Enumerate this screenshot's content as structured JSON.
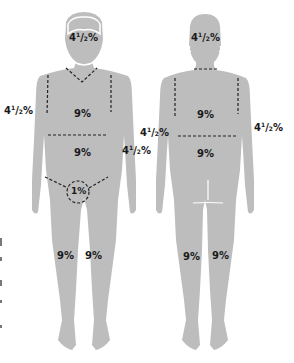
{
  "colors": {
    "silhouette": "#bdbdbd",
    "outline_highlight": "#ffffff",
    "dashed_line": "#222222",
    "label_text": "#1a1a1a",
    "background": "#ffffff"
  },
  "front": {
    "head": {
      "whole": "4",
      "num": "1",
      "den": "2",
      "pct": "%"
    },
    "right_arm_outside": {
      "whole": "4",
      "num": "1",
      "den": "2",
      "pct": "%"
    },
    "left_arm": {
      "whole": "4",
      "num": "1",
      "den": "2",
      "pct": "%"
    },
    "chest": "9%",
    "abdomen": "9%",
    "genitals": "1%",
    "right_leg": "9%",
    "left_leg": "9%"
  },
  "back": {
    "head": {
      "whole": "4",
      "num": "1",
      "den": "2",
      "pct": "%"
    },
    "left_arm_outside": {
      "whole": "4",
      "num": "1",
      "den": "2",
      "pct": "%"
    },
    "right_arm_outside": {
      "whole": "4",
      "num": "1",
      "den": "2",
      "pct": "%"
    },
    "upper_back": "9%",
    "lower_back": "9%",
    "left_leg": "9%",
    "right_leg": "9%"
  }
}
